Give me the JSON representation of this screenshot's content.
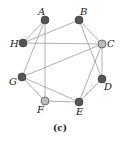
{
  "graph": {
    "nodes": [
      {
        "id": "A",
        "x": 45,
        "y": 20,
        "color": "#555555",
        "lx": 38,
        "ly": 15
      },
      {
        "id": "B",
        "x": 79,
        "y": 20,
        "color": "#555555",
        "lx": 80,
        "ly": 15
      },
      {
        "id": "H",
        "x": 23,
        "y": 43,
        "color": "#555555",
        "lx": 10,
        "ly": 47
      },
      {
        "id": "C",
        "x": 102,
        "y": 44,
        "color": "#bbbbbb",
        "lx": 107,
        "ly": 47
      },
      {
        "id": "G",
        "x": 22,
        "y": 77,
        "color": "#555555",
        "lx": 9,
        "ly": 85
      },
      {
        "id": "D",
        "x": 102,
        "y": 79,
        "color": "#555555",
        "lx": 104,
        "ly": 90
      },
      {
        "id": "F",
        "x": 45,
        "y": 101,
        "color": "#bbbbbb",
        "lx": 37,
        "ly": 113
      },
      {
        "id": "E",
        "x": 79,
        "y": 102,
        "color": "#555555",
        "lx": 76,
        "ly": 115
      }
    ],
    "edges": [
      [
        "A",
        "H"
      ],
      [
        "A",
        "G"
      ],
      [
        "A",
        "F"
      ],
      [
        "H",
        "B"
      ],
      [
        "H",
        "C"
      ],
      [
        "B",
        "C"
      ],
      [
        "B",
        "D"
      ],
      [
        "C",
        "G"
      ],
      [
        "C",
        "D"
      ],
      [
        "C",
        "E"
      ],
      [
        "G",
        "F"
      ],
      [
        "G",
        "E"
      ],
      [
        "F",
        "E"
      ],
      [
        "D",
        "E"
      ]
    ]
  },
  "caption": "(c)"
}
